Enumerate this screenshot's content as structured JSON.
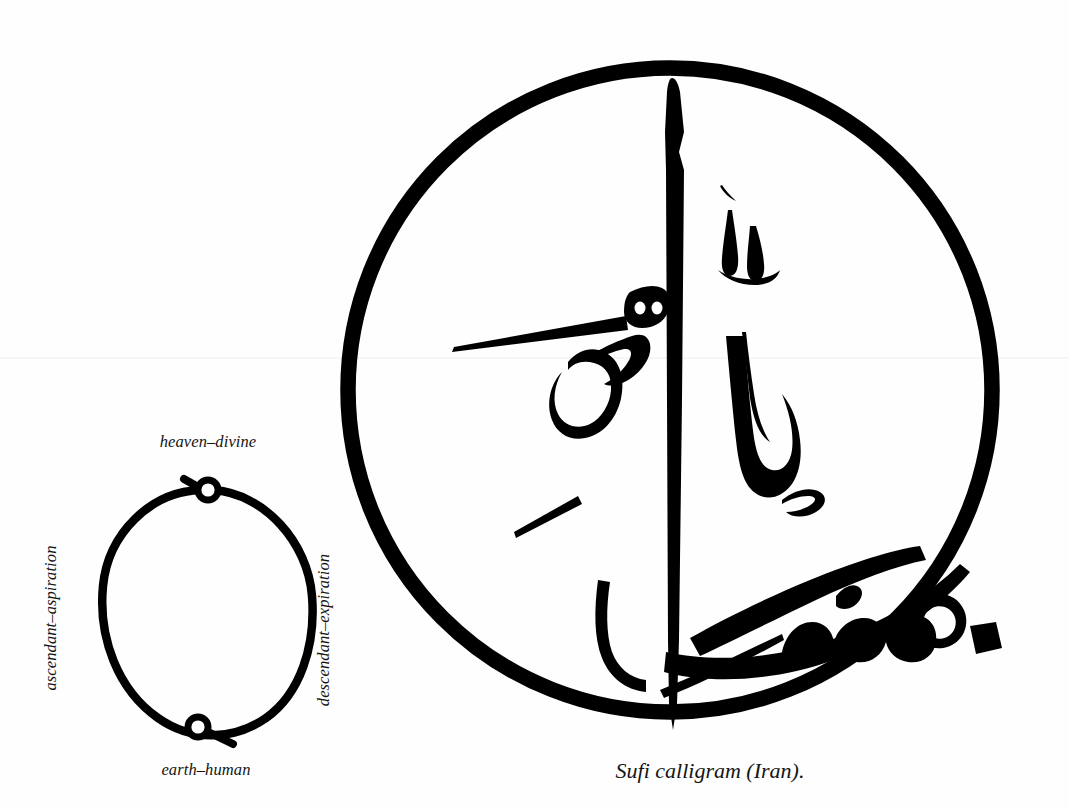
{
  "figure": {
    "caption": "Sufi calligram (Iran).",
    "ink_color": "#000000",
    "background_color": "#fefefe"
  },
  "diagram": {
    "name": "breath-circle-diagram",
    "labels": {
      "top": "heaven–divine",
      "bottom": "earth–human",
      "left": "ascendant–aspiration",
      "right": "descendant–expiration"
    },
    "nodes": [
      {
        "id": "top-node",
        "label": "heaven–divine",
        "position": "top"
      },
      {
        "id": "bottom-node",
        "label": "earth–human",
        "position": "bottom"
      }
    ],
    "arcs": [
      {
        "id": "left-arc",
        "label": "ascendant–aspiration",
        "side": "left"
      },
      {
        "id": "right-arc",
        "label": "descendant–expiration",
        "side": "right"
      }
    ]
  },
  "calligram": {
    "name": "bismillah-calligram",
    "script": "Arabic",
    "transliteration": "Bismillah",
    "words": [
      {
        "id": "bism",
        "text": "بسم"
      },
      {
        "id": "allah",
        "text": "الله"
      }
    ],
    "enclosure": "circle"
  }
}
